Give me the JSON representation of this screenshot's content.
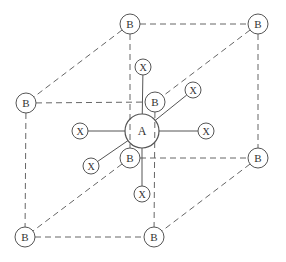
{
  "diagram": {
    "title": "",
    "colors": {
      "stroke": "#555555",
      "dashed": "#666666",
      "text": "#333333",
      "background": "#ffffff"
    },
    "center_atom": {
      "label": "A",
      "x": 142,
      "y": 131,
      "r": 17
    },
    "b_nodes": [
      {
        "id": "b_top_back_left",
        "label": "B",
        "x": 130,
        "y": 24
      },
      {
        "id": "b_top_back_right",
        "label": "B",
        "x": 258,
        "y": 24
      },
      {
        "id": "b_top_front_left",
        "label": "B",
        "x": 26,
        "y": 103
      },
      {
        "id": "b_top_front_right",
        "label": "B",
        "x": 155,
        "y": 102
      },
      {
        "id": "b_bottom_back_left",
        "label": "B",
        "x": 130,
        "y": 158
      },
      {
        "id": "b_bottom_back_right",
        "label": "B",
        "x": 258,
        "y": 158
      },
      {
        "id": "b_bottom_front_left",
        "label": "B",
        "x": 25,
        "y": 237
      },
      {
        "id": "b_bottom_front_right",
        "label": "B",
        "x": 154,
        "y": 237
      }
    ],
    "x_nodes": [
      {
        "id": "x_top",
        "label": "X",
        "x": 143,
        "y": 67
      },
      {
        "id": "x_upper_right",
        "label": "X",
        "x": 193,
        "y": 90
      },
      {
        "id": "x_left",
        "label": "X",
        "x": 80,
        "y": 131
      },
      {
        "id": "x_right",
        "label": "X",
        "x": 206,
        "y": 131
      },
      {
        "id": "x_lower_left",
        "label": "X",
        "x": 91,
        "y": 166
      },
      {
        "id": "x_bottom",
        "label": "X",
        "x": 142,
        "y": 194
      }
    ],
    "b_radius": 10,
    "x_radius": 8,
    "cube_edges": [
      [
        "b_top_back_left",
        "b_top_back_right"
      ],
      [
        "b_top_back_left",
        "b_top_front_left"
      ],
      [
        "b_top_back_right",
        "b_top_front_right"
      ],
      [
        "b_top_front_left",
        "b_top_front_right"
      ],
      [
        "b_bottom_back_left",
        "b_bottom_back_right"
      ],
      [
        "b_bottom_back_left",
        "b_bottom_front_left"
      ],
      [
        "b_bottom_back_right",
        "b_bottom_front_right"
      ],
      [
        "b_bottom_front_left",
        "b_bottom_front_right"
      ],
      [
        "b_top_back_left",
        "b_bottom_back_left"
      ],
      [
        "b_top_back_right",
        "b_bottom_back_right"
      ],
      [
        "b_top_front_left",
        "b_bottom_front_left"
      ],
      [
        "b_top_front_right",
        "b_bottom_front_right"
      ]
    ],
    "bond_targets": [
      "x_top",
      "x_upper_right",
      "x_left",
      "x_right",
      "x_lower_left",
      "x_bottom"
    ]
  }
}
